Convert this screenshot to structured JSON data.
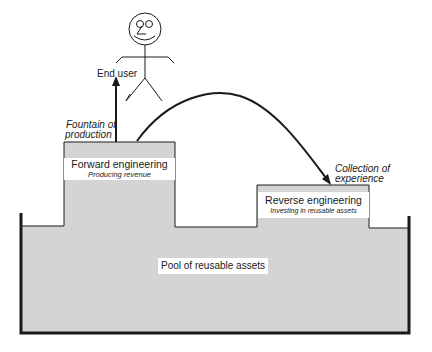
{
  "diagram": {
    "end_user": {
      "label": "End user"
    },
    "fountain": {
      "line1": "Fountain of",
      "line2": "production"
    },
    "forward": {
      "title": "Forward engineering",
      "subtitle": "Producing revenue"
    },
    "reverse": {
      "title": "Reverse engineering",
      "subtitle": "Investing in reusable assets"
    },
    "collection": {
      "line1": "Collection of",
      "line2": "experience"
    },
    "pool": {
      "label": "Pool of reusable assets"
    },
    "colors": {
      "fill": "#d4d4d4",
      "stroke": "#1a1a1a",
      "background": "#ffffff"
    }
  }
}
